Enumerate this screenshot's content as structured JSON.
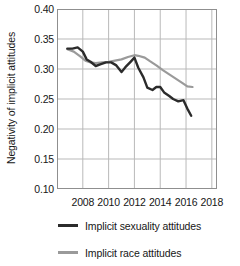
{
  "chart_data": {
    "type": "line",
    "title": "",
    "xlabel": "",
    "ylabel": "Negativity of implicit attitudes",
    "xlim": [
      2006,
      2018.4
    ],
    "ylim": [
      0.1,
      0.4
    ],
    "grid": true,
    "legend_position": "bottom",
    "xticks": [
      2008,
      2010,
      2012,
      2014,
      2016,
      2018
    ],
    "xticklabels": [
      "2008",
      "2010",
      "2012",
      "2014",
      "2016",
      "2018"
    ],
    "yticks": [
      0.1,
      0.15,
      0.2,
      0.25,
      0.3,
      0.35,
      0.4
    ],
    "yticklabels": [
      "0.10",
      "0.15",
      "0.20",
      "0.25",
      "0.30",
      "0.35",
      "0.40"
    ],
    "series": [
      {
        "name": "Implicit sexuality attitudes",
        "color": "#2b2b2b",
        "x": [
          2006.8,
          2007.2,
          2007.6,
          2008.0,
          2008.3,
          2008.6,
          2009.0,
          2009.4,
          2009.8,
          2010.2,
          2010.6,
          2011.0,
          2011.3,
          2011.7,
          2012.0,
          2012.3,
          2012.7,
          2013.0,
          2013.4,
          2013.7,
          2014.0,
          2014.3,
          2014.7,
          2015.0,
          2015.4,
          2015.8,
          2016.1,
          2016.4
        ],
        "y": [
          0.334,
          0.334,
          0.336,
          0.329,
          0.316,
          0.312,
          0.305,
          0.308,
          0.311,
          0.311,
          0.306,
          0.295,
          0.303,
          0.312,
          0.319,
          0.302,
          0.286,
          0.269,
          0.265,
          0.27,
          0.27,
          0.261,
          0.255,
          0.25,
          0.246,
          0.248,
          0.234,
          0.222
        ]
      },
      {
        "name": "Implicit race attitudes",
        "color": "#9a9a9a",
        "x": [
          2006.8,
          2007.3,
          2007.8,
          2008.2,
          2008.6,
          2009.0,
          2009.5,
          2010.0,
          2010.5,
          2011.0,
          2011.5,
          2012.0,
          2012.3,
          2012.8,
          2013.2,
          2013.7,
          2014.2,
          2014.7,
          2015.2,
          2015.7,
          2016.1,
          2016.5
        ],
        "y": [
          0.333,
          0.329,
          0.321,
          0.314,
          0.311,
          0.31,
          0.311,
          0.312,
          0.314,
          0.316,
          0.32,
          0.323,
          0.322,
          0.319,
          0.313,
          0.306,
          0.298,
          0.291,
          0.284,
          0.277,
          0.271,
          0.27
        ]
      }
    ]
  },
  "legend": {
    "items": [
      {
        "label": "Implicit sexuality attitudes",
        "color": "#2b2b2b"
      },
      {
        "label": "Implicit race attitudes",
        "color": "#9a9a9a"
      }
    ]
  }
}
